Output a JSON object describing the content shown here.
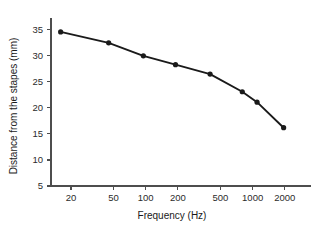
{
  "chart_data": {
    "type": "line",
    "title": "",
    "subtitle": "",
    "xlabel": "Frequency (Hz)",
    "ylabel": "Distance from the stapes (mm)",
    "xscale": "log",
    "yscale": "linear",
    "xlim": [
      13,
      2600
    ],
    "ylim": [
      5,
      36.5
    ],
    "xticks": [
      20,
      50,
      100,
      200,
      500,
      1000,
      2000
    ],
    "xticklabels": [
      "20",
      "50",
      "100",
      "200",
      "500",
      "1000",
      "2000"
    ],
    "yticks": [
      5,
      10,
      15,
      20,
      25,
      30,
      35
    ],
    "yticklabels": [
      "5",
      "10",
      "15",
      "20",
      "25",
      "30",
      "35"
    ],
    "grid": false,
    "legend": false,
    "legend_position": "none",
    "marker": "filled-circle",
    "line_color": "#1a1a1a",
    "marker_color": "#1a1a1a",
    "axis_color": "#4d4d4d",
    "background_color": "#ffffff",
    "x": [
      16,
      45,
      95,
      190,
      400,
      800,
      1100,
      1950
    ],
    "y": [
      34.6,
      32.5,
      30.0,
      28.3,
      26.5,
      23.1,
      21.1,
      16.2
    ],
    "series": [
      {
        "name": "Distance from the stapes",
        "x": [
          16,
          45,
          95,
          190,
          400,
          800,
          1100,
          1950
        ],
        "values": [
          34.6,
          32.5,
          30.0,
          28.3,
          26.5,
          23.1,
          21.1,
          16.2
        ]
      }
    ],
    "annotations": []
  }
}
